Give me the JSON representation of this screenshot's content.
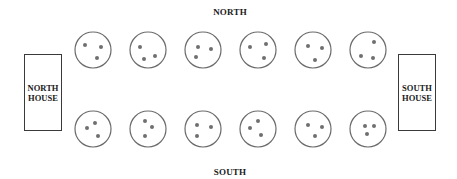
{
  "labels": {
    "north": "NORTH",
    "south": "SOUTH"
  },
  "houses": {
    "north": {
      "line1": "NORTH",
      "line2": "HOUSE"
    },
    "south": {
      "line1": "SOUTH",
      "line2": "HOUSE"
    }
  },
  "style": {
    "stroke_color": "#6b6b6b",
    "dot_color": "#6f6f6f",
    "text_color": "#1a1a1a"
  },
  "rows": {
    "top": {
      "cy": 50,
      "pots": [
        {
          "cx": 93,
          "dots": [
            [
              -8,
              -5
            ],
            [
              8,
              -3
            ],
            [
              4,
              8
            ]
          ]
        },
        {
          "cx": 148,
          "dots": [
            [
              -8,
              -3
            ],
            [
              -4,
              9
            ],
            [
              7,
              6
            ]
          ]
        },
        {
          "cx": 203,
          "dots": [
            [
              -5,
              -3
            ],
            [
              8,
              -1
            ],
            [
              -7,
              7
            ]
          ]
        },
        {
          "cx": 258,
          "dots": [
            [
              -8,
              -3
            ],
            [
              8,
              -6
            ],
            [
              6,
              8
            ]
          ]
        },
        {
          "cx": 313,
          "dots": [
            [
              -5,
              -4
            ],
            [
              9,
              -2
            ],
            [
              2,
              10
            ]
          ]
        },
        {
          "cx": 368,
          "dots": [
            [
              6,
              -8
            ],
            [
              -7,
              6
            ],
            [
              5,
              8
            ]
          ]
        }
      ]
    },
    "bottom": {
      "cy": 129,
      "pots": [
        {
          "cx": 93,
          "dots": [
            [
              2,
              -6
            ],
            [
              -6,
              -1
            ],
            [
              5,
              7
            ]
          ]
        },
        {
          "cx": 148,
          "dots": [
            [
              -3,
              -8
            ],
            [
              4,
              -2
            ],
            [
              -3,
              7
            ]
          ]
        },
        {
          "cx": 203,
          "dots": [
            [
              -6,
              -4
            ],
            [
              8,
              -2
            ],
            [
              -6,
              7
            ]
          ]
        },
        {
          "cx": 258,
          "dots": [
            [
              0,
              -8
            ],
            [
              -8,
              -1
            ],
            [
              3,
              6
            ]
          ]
        },
        {
          "cx": 313,
          "dots": [
            [
              -5,
              -4
            ],
            [
              9,
              -2
            ],
            [
              2,
              7
            ]
          ]
        },
        {
          "cx": 368,
          "dots": [
            [
              -3,
              -3
            ],
            [
              6,
              -3
            ],
            [
              -1,
              5
            ]
          ]
        }
      ]
    },
    "radius": 18,
    "dot_radius": 2
  }
}
